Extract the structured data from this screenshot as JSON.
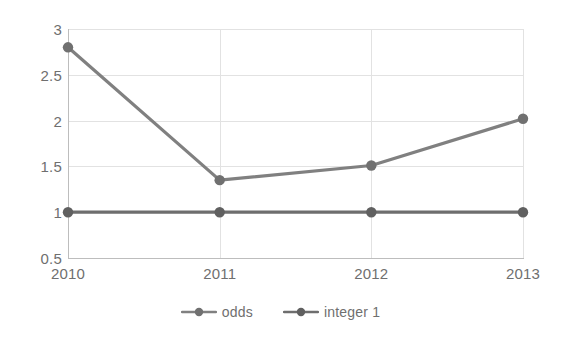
{
  "chart_data": {
    "type": "line",
    "title": "",
    "subtitle": "",
    "xlabel": "",
    "ylabel": "",
    "categories": [
      "2010",
      "2011",
      "2012",
      "2013"
    ],
    "x": [
      2010,
      2011,
      2012,
      2013
    ],
    "series": [
      {
        "name": "odds",
        "values": [
          2.8,
          1.35,
          1.51,
          2.02
        ],
        "color": "#808080",
        "marker": "circle"
      },
      {
        "name": "integer 1",
        "values": [
          1.0,
          1.0,
          1.0,
          1.0
        ],
        "color": "#6e6e6e",
        "marker": "circle"
      }
    ],
    "ylim": [
      0.5,
      3
    ],
    "yticks": [
      "0.5",
      "1",
      "1.5",
      "2",
      "2.5",
      "3"
    ],
    "ytick_values": [
      0.5,
      1,
      1.5,
      2,
      2.5,
      3
    ],
    "xticks": [
      "2010",
      "2011",
      "2012",
      "2013"
    ],
    "grid": true,
    "grid_color": "#e2e2e2",
    "legend": true,
    "legend_position": "bottom",
    "legend_entries": [
      "odds",
      "integer 1"
    ],
    "background": "#ffffff",
    "axis_color": "#bdbdbd",
    "tick_label_color": "#6f6f6f"
  },
  "legend": {
    "items": [
      {
        "label": "odds",
        "icon": "line-marker-icon"
      },
      {
        "label": "integer 1",
        "icon": "line-marker-icon"
      }
    ]
  }
}
